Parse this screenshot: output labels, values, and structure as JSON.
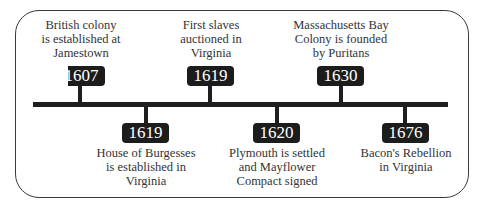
{
  "timeline": {
    "events": [
      {
        "year": "1607",
        "position": "above",
        "lines": [
          "British colony",
          "is established at",
          "Jamestown"
        ]
      },
      {
        "year": "1619",
        "position": "below",
        "lines": [
          "House of Burgesses",
          "is established in",
          "Virginia"
        ]
      },
      {
        "year": "1619",
        "position": "above",
        "lines": [
          "First slaves",
          "auctioned in",
          "Virginia"
        ]
      },
      {
        "year": "1620",
        "position": "below",
        "lines": [
          "Plymouth is settled",
          "and Mayflower",
          "Compact signed"
        ]
      },
      {
        "year": "1630",
        "position": "above",
        "lines": [
          "Massachusetts Bay",
          "Colony is founded",
          "by Puritans"
        ]
      },
      {
        "year": "1676",
        "position": "below",
        "lines": [
          "Bacon's Rebellion",
          "in Virginia"
        ]
      }
    ]
  },
  "colors": {
    "ink": "#1c1c1c",
    "text": "#333333",
    "background": "#ffffff"
  }
}
